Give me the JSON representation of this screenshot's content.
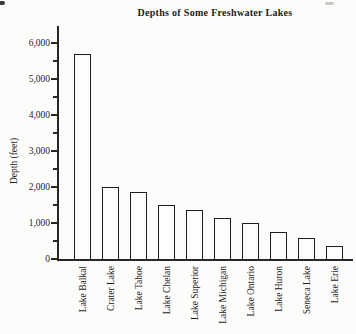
{
  "page": {
    "paper_color": "#fcfcfa",
    "ink_color": "#1c1c1c"
  },
  "chart_data": {
    "type": "bar",
    "title": "Depths of Some Freshwater Lakes",
    "ylabel": "Depth (feet)",
    "xlabel": "",
    "categories": [
      "Lake Balkal",
      "Crater Lake",
      "Lake Tahoe",
      "Lake Chelan",
      "Lake Superior",
      "Lake Michigan",
      "Lake Ontario",
      "Lake Huron",
      "Seneca Lake",
      "Lake Erie"
    ],
    "values": [
      5700,
      2000,
      1850,
      1500,
      1350,
      1150,
      1000,
      750,
      575,
      375
    ],
    "ylim": [
      0,
      6000
    ],
    "ytick_interval": 1000,
    "minor_tick_interval": 500,
    "ytick_labels": [
      "0",
      "1,000",
      "2,000",
      "3,000",
      "4,000",
      "5,000",
      "6,000"
    ],
    "grid": false,
    "legend": null,
    "bar_fill": "#fdfdfc",
    "bar_border": "#1d1d1d"
  }
}
